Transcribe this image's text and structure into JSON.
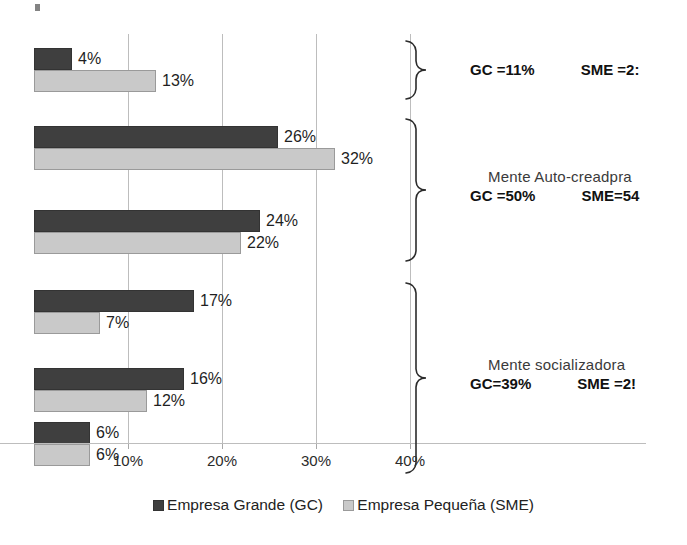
{
  "chart_data": {
    "type": "bar",
    "orientation": "horizontal",
    "title": "",
    "xlabel": "",
    "ylabel": "",
    "xlim": [
      0,
      44
    ],
    "xticks": [
      "10%",
      "20%",
      "30%",
      "40%"
    ],
    "xtick_values": [
      10,
      20,
      30,
      40
    ],
    "grid": true,
    "legend_position": "bottom",
    "categories": [
      "item-1",
      "item-2",
      "item-3",
      "item-4",
      "item-5",
      "item-6"
    ],
    "series": [
      {
        "name": "Empresa Grande (GC)",
        "key": "gc",
        "color": "#3f3f3f",
        "values": [
          4,
          26,
          24,
          17,
          16,
          6
        ],
        "labels": [
          "4%",
          "26%",
          "24%",
          "17%",
          "16%",
          "6%"
        ]
      },
      {
        "name": "Empresa Pequeña (SME)",
        "key": "sme",
        "color": "#c9c9c9",
        "values": [
          13,
          32,
          22,
          7,
          12,
          6
        ],
        "labels": [
          "13%",
          "32%",
          "22%",
          "7%",
          "12%",
          "6%"
        ]
      }
    ],
    "annotations": [
      {
        "title": "",
        "gc_label": "GC =11%",
        "sme_label": "SME =2:",
        "groups": [
          0
        ]
      },
      {
        "title": "Mente Auto-creadpra",
        "gc_label": "GC =50%",
        "sme_label": "SME=54",
        "groups": [
          1,
          2
        ]
      },
      {
        "title": "Mente socializadora",
        "gc_label": "GC=39%",
        "sme_label": "SME =2!",
        "groups": [
          3,
          4,
          5
        ]
      }
    ]
  },
  "legend": {
    "entries": [
      {
        "label": "Empresa Grande (GC)",
        "key": "gc"
      },
      {
        "label": "Empresa Pequeña (SME)",
        "key": "sme"
      }
    ]
  },
  "colors": {
    "gc": "#3f3f3f",
    "sme": "#c9c9c9",
    "grid": "#bdbdbd",
    "text": "#1f1f1f"
  }
}
